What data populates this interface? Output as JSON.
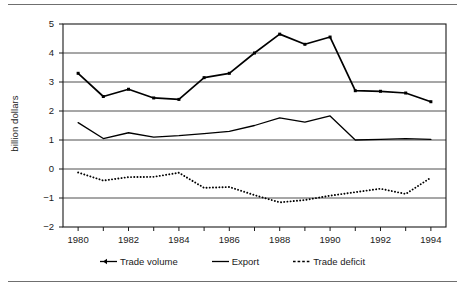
{
  "chart_data": {
    "type": "line",
    "title": "",
    "subtitle": "",
    "xlabel": "",
    "ylabel": "billion dollars",
    "x": [
      1980,
      1981,
      1982,
      1983,
      1984,
      1985,
      1986,
      1987,
      1988,
      1989,
      1990,
      1991,
      1992,
      1993,
      1994
    ],
    "xlim": [
      1979.4,
      1994.6
    ],
    "ylim": [
      -2,
      5
    ],
    "xtick_labels": [
      "1980",
      "1982",
      "1984",
      "1986",
      "1988",
      "1990",
      "1992",
      "1994"
    ],
    "xtick_values": [
      1980,
      1982,
      1984,
      1986,
      1988,
      1990,
      1992,
      1994
    ],
    "ytick_labels": [
      "5",
      "4",
      "3",
      "2",
      "1",
      "0",
      "−1",
      "−2"
    ],
    "ytick_values": [
      5,
      4,
      3,
      2,
      1,
      0,
      -1,
      -2
    ],
    "grid": true,
    "grid_axis": "y",
    "legend_position": "bottom",
    "series": [
      {
        "name": "Trade volume",
        "style": "solid-with-markers",
        "color": "#000000",
        "values": [
          3.3,
          2.5,
          2.75,
          2.45,
          2.4,
          3.15,
          3.3,
          4.0,
          4.65,
          4.3,
          4.55,
          2.7,
          2.68,
          2.62,
          2.32
        ]
      },
      {
        "name": "Export",
        "style": "solid",
        "color": "#000000",
        "values": [
          1.6,
          1.05,
          1.25,
          1.1,
          1.15,
          1.22,
          1.3,
          1.5,
          1.76,
          1.62,
          1.83,
          1.0,
          1.02,
          1.05,
          1.02
        ]
      },
      {
        "name": "Trade deficit",
        "style": "dotted",
        "color": "#000000",
        "values": [
          -0.12,
          -0.4,
          -0.28,
          -0.27,
          -0.13,
          -0.65,
          -0.62,
          -0.9,
          -1.15,
          -1.07,
          -0.92,
          -0.8,
          -0.68,
          -0.86,
          -0.3
        ]
      }
    ]
  },
  "legend": {
    "items": [
      {
        "label": "Trade volume",
        "icon": "line-marker-icon"
      },
      {
        "label": "Export",
        "icon": "line-solid-icon"
      },
      {
        "label": "Trade deficit",
        "icon": "line-dotted-icon"
      }
    ]
  },
  "axis": {
    "y_title": "billion dollars"
  }
}
